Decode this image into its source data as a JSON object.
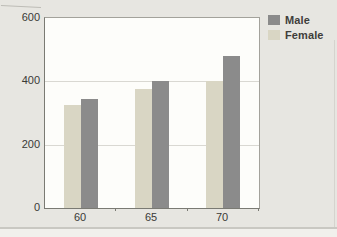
{
  "figure": {
    "background_color": "#e7e6e1",
    "plot_background_color": "#fdfdfa"
  },
  "chart_data": {
    "type": "bar",
    "title": "",
    "xlabel": "",
    "ylabel": "",
    "categories": [
      "60",
      "65",
      "70"
    ],
    "series": [
      {
        "name": "Male",
        "color": "#8b8b8b",
        "values": [
          345,
          400,
          480
        ]
      },
      {
        "name": "Female",
        "color": "#d9d6c4",
        "values": [
          325,
          375,
          400
        ]
      }
    ],
    "bar_order": [
      "Female",
      "Male"
    ],
    "ylim": [
      0,
      600
    ],
    "yticks": [
      0,
      200,
      400,
      600
    ],
    "grid": "horizontal",
    "legend_position": "top-right outside plot",
    "legend": [
      {
        "label": "Male",
        "color": "#8b8b8b"
      },
      {
        "label": "Female",
        "color": "#d9d6c4"
      }
    ]
  }
}
